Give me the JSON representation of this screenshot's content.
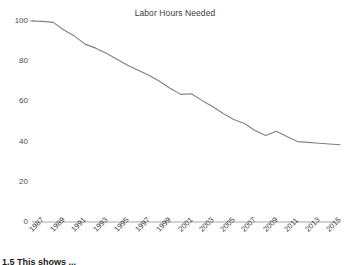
{
  "chart_data": {
    "type": "line",
    "title": "Labor Hours Needed",
    "xlabel": "",
    "ylabel": "",
    "x": [
      1987,
      1988,
      1989,
      1990,
      1991,
      1992,
      1993,
      1994,
      1995,
      1996,
      1997,
      1998,
      1999,
      2000,
      2001,
      2002,
      2003,
      2004,
      2005,
      2006,
      2007,
      2008,
      2009,
      2010,
      2011,
      2012,
      2013,
      2014,
      2015,
      2016
    ],
    "values": [
      100,
      99.8,
      99.3,
      95.5,
      92.5,
      88.5,
      86.5,
      84,
      81,
      78,
      75.5,
      73,
      70,
      66.5,
      63.5,
      63.8,
      60.5,
      57.5,
      54,
      51,
      49,
      45.5,
      43,
      45.2,
      42.5,
      40,
      39.6,
      39.2,
      38.8,
      38.4
    ],
    "series_name": "Labor Hours Needed",
    "line_color": "#808080",
    "axis_color": "#a6a6a6",
    "grid": false,
    "legend": "none",
    "xlim": [
      1987,
      2016
    ],
    "ylim": [
      0,
      100
    ],
    "ytick_labels": [
      "100",
      "80",
      "60",
      "40",
      "20",
      "0"
    ],
    "ytick_values": [
      100,
      80,
      60,
      40,
      20,
      0
    ],
    "xtick_labels": [
      "1987",
      "1989",
      "1991",
      "1993",
      "1995",
      "1997",
      "1999",
      "2001",
      "2003",
      "2005",
      "2007",
      "2009",
      "2011",
      "2013",
      "2015"
    ],
    "xtick_values": [
      1987,
      1989,
      1991,
      1993,
      1995,
      1997,
      1999,
      2001,
      2003,
      2005,
      2007,
      2009,
      2011,
      2013,
      2015
    ]
  },
  "caption": {
    "text": "1.5 This shows ..."
  }
}
